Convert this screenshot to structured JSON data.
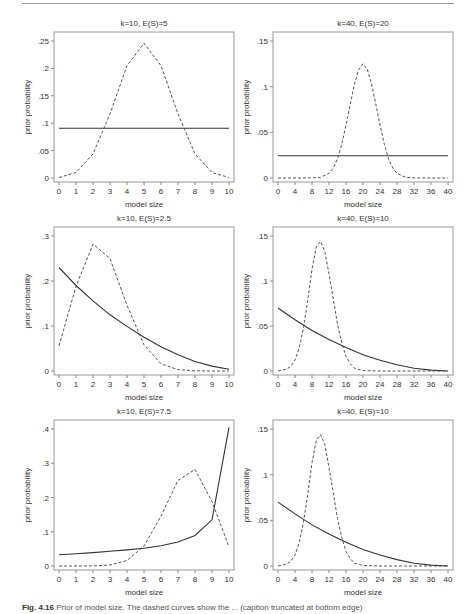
{
  "figure": {
    "caption_label": "Fig. 4.16",
    "caption_text": "Prior of model size. The dashed curves show the ... (caption truncated at bottom edge)"
  },
  "chart_data": [
    {
      "id": "panel-1",
      "type": "line",
      "title": "k=10, E(S)=5",
      "xlabel": "model size",
      "ylabel": "prior probability",
      "xlim": [
        0,
        10
      ],
      "ylim": [
        0,
        0.25
      ],
      "xticks": [
        0,
        1,
        2,
        3,
        4,
        5,
        6,
        7,
        8,
        9,
        10
      ],
      "xtick_labels": [
        "0",
        "1",
        "2",
        "3",
        "4",
        "5",
        "6",
        "7",
        "8",
        "9",
        "10"
      ],
      "yticks": [
        0,
        0.05,
        0.1,
        0.15,
        0.2,
        0.25
      ],
      "ytick_labels": [
        "0",
        ".05",
        ".1",
        ".15",
        ".2",
        ".25"
      ],
      "grid": false,
      "series": [
        {
          "name": "fixed (solid)",
          "style": "solid",
          "x": [
            0,
            10
          ],
          "values": [
            0.0909,
            0.0909
          ]
        },
        {
          "name": "random theta (dashed)",
          "style": "dashed",
          "x": [
            0,
            1,
            2,
            3,
            4,
            5,
            6,
            7,
            8,
            9,
            10
          ],
          "values": [
            0.001,
            0.01,
            0.044,
            0.117,
            0.205,
            0.246,
            0.205,
            0.117,
            0.044,
            0.01,
            0.001
          ]
        }
      ]
    },
    {
      "id": "panel-2",
      "type": "line",
      "title": "k=40, E(S)=20",
      "xlabel": "model size",
      "ylabel": "prior probability",
      "xlim": [
        0,
        40
      ],
      "ylim": [
        0,
        0.15
      ],
      "xticks": [
        0,
        4,
        8,
        12,
        16,
        20,
        24,
        28,
        32,
        36,
        40
      ],
      "xtick_labels": [
        "0",
        "4",
        "8",
        "12",
        "16",
        "20",
        "24",
        "28",
        "32",
        "36",
        "40"
      ],
      "yticks": [
        0,
        0.05,
        0.1,
        0.15
      ],
      "ytick_labels": [
        "0",
        ".05",
        ".1",
        ".15"
      ],
      "grid": false,
      "series": [
        {
          "name": "fixed (solid)",
          "style": "solid",
          "x": [
            0,
            40
          ],
          "values": [
            0.0244,
            0.0244
          ]
        },
        {
          "name": "random theta (dashed)",
          "style": "dashed",
          "x": [
            0,
            4,
            8,
            10,
            12,
            13,
            14,
            15,
            16,
            17,
            18,
            19,
            20,
            21,
            22,
            23,
            24,
            25,
            26,
            27,
            28,
            30,
            32,
            36,
            40
          ],
          "values": [
            0,
            0,
            0.0001,
            0.0008,
            0.005,
            0.011,
            0.021,
            0.037,
            0.058,
            0.081,
            0.103,
            0.119,
            0.125,
            0.119,
            0.103,
            0.081,
            0.058,
            0.037,
            0.021,
            0.011,
            0.005,
            0.0008,
            0.0001,
            0,
            0
          ]
        }
      ]
    },
    {
      "id": "panel-3",
      "type": "line",
      "title": "k=10, E(S)=2.5",
      "xlabel": "model size",
      "ylabel": "prior probability",
      "xlim": [
        0,
        10
      ],
      "ylim": [
        0,
        0.3
      ],
      "xticks": [
        0,
        1,
        2,
        3,
        4,
        5,
        6,
        7,
        8,
        9,
        10
      ],
      "xtick_labels": [
        "0",
        "1",
        "2",
        "3",
        "4",
        "5",
        "6",
        "7",
        "8",
        "9",
        "10"
      ],
      "yticks": [
        0,
        0.1,
        0.2,
        0.3
      ],
      "ytick_labels": [
        "0",
        ".1",
        ".2",
        ".3"
      ],
      "grid": false,
      "series": [
        {
          "name": "random theta (solid)",
          "style": "solid",
          "x": [
            0,
            1,
            2,
            3,
            4,
            5,
            6,
            7,
            8,
            9,
            10
          ],
          "values": [
            0.23,
            0.19,
            0.156,
            0.125,
            0.099,
            0.075,
            0.054,
            0.036,
            0.021,
            0.011,
            0.004
          ]
        },
        {
          "name": "fixed (dashed)",
          "style": "dashed",
          "x": [
            0,
            1,
            2,
            3,
            4,
            5,
            6,
            7,
            8,
            9,
            10
          ],
          "values": [
            0.056,
            0.188,
            0.282,
            0.25,
            0.146,
            0.058,
            0.016,
            0.003,
            0.0004,
            0,
            0
          ]
        }
      ]
    },
    {
      "id": "panel-4",
      "type": "line",
      "title": "k=40, E(S)=10",
      "xlabel": "model size",
      "ylabel": "prior probability",
      "xlim": [
        0,
        40
      ],
      "ylim": [
        0,
        0.15
      ],
      "xticks": [
        0,
        4,
        8,
        12,
        16,
        20,
        24,
        28,
        32,
        36,
        40
      ],
      "xtick_labels": [
        "0",
        "4",
        "8",
        "12",
        "16",
        "20",
        "24",
        "28",
        "32",
        "36",
        "40"
      ],
      "yticks": [
        0,
        0.05,
        0.1,
        0.15
      ],
      "ytick_labels": [
        "0",
        ".05",
        ".1",
        ".15"
      ],
      "grid": false,
      "series": [
        {
          "name": "random theta (solid)",
          "style": "solid",
          "x": [
            0,
            4,
            8,
            12,
            16,
            20,
            24,
            28,
            32,
            36,
            40
          ],
          "values": [
            0.07,
            0.057,
            0.045,
            0.035,
            0.026,
            0.018,
            0.012,
            0.007,
            0.003,
            0.001,
            0
          ]
        },
        {
          "name": "fixed (dashed)",
          "style": "dashed",
          "x": [
            0,
            2,
            3,
            4,
            5,
            6,
            7,
            8,
            9,
            10,
            11,
            12,
            13,
            14,
            15,
            16,
            17,
            18,
            20,
            24,
            28,
            32,
            36,
            40
          ],
          "values": [
            0,
            0.002,
            0.005,
            0.012,
            0.026,
            0.048,
            0.079,
            0.113,
            0.138,
            0.144,
            0.133,
            0.108,
            0.08,
            0.052,
            0.031,
            0.016,
            0.008,
            0.003,
            0.0005,
            0,
            0,
            0,
            0,
            0
          ]
        }
      ]
    },
    {
      "id": "panel-5",
      "type": "line",
      "title": "k=10, E(S)=7.5",
      "xlabel": "model size",
      "ylabel": "prior probability",
      "xlim": [
        0,
        10
      ],
      "ylim": [
        0,
        0.4
      ],
      "xticks": [
        0,
        1,
        2,
        3,
        4,
        5,
        6,
        7,
        8,
        9,
        10
      ],
      "xtick_labels": [
        "0",
        "1",
        "2",
        "3",
        "4",
        "5",
        "6",
        "7",
        "8",
        "9",
        "10"
      ],
      "yticks": [
        0,
        0.1,
        0.2,
        0.3,
        0.4
      ],
      "ytick_labels": [
        "0",
        ".1",
        ".2",
        ".3",
        ".4"
      ],
      "grid": false,
      "series": [
        {
          "name": "random theta (solid)",
          "style": "solid",
          "x": [
            0,
            1,
            2,
            3,
            4,
            5,
            6,
            7,
            8,
            9,
            10
          ],
          "values": [
            0.033,
            0.036,
            0.039,
            0.043,
            0.047,
            0.052,
            0.059,
            0.07,
            0.089,
            0.135,
            0.405
          ]
        },
        {
          "name": "fixed (dashed)",
          "style": "dashed",
          "x": [
            0,
            1,
            2,
            3,
            4,
            5,
            6,
            7,
            8,
            9,
            10
          ],
          "values": [
            0,
            0,
            0.0004,
            0.003,
            0.016,
            0.058,
            0.146,
            0.25,
            0.282,
            0.188,
            0.056
          ]
        }
      ]
    },
    {
      "id": "panel-6",
      "type": "line",
      "title": "k=40, E(S)=10",
      "xlabel": "model size",
      "ylabel": "prior probability",
      "xlim": [
        0,
        40
      ],
      "ylim": [
        0,
        0.15
      ],
      "xticks": [
        0,
        4,
        8,
        12,
        16,
        20,
        24,
        28,
        32,
        36,
        40
      ],
      "xtick_labels": [
        "0",
        "4",
        "8",
        "12",
        "16",
        "20",
        "24",
        "28",
        "32",
        "36",
        "40"
      ],
      "yticks": [
        0,
        0.05,
        0.1,
        0.15
      ],
      "ytick_labels": [
        "0",
        ".05",
        ".1",
        ".15"
      ],
      "grid": false,
      "series": [
        {
          "name": "random theta (solid)",
          "style": "solid",
          "x": [
            0,
            4,
            8,
            12,
            16,
            20,
            24,
            28,
            32,
            36,
            40
          ],
          "values": [
            0.07,
            0.057,
            0.045,
            0.035,
            0.026,
            0.018,
            0.012,
            0.007,
            0.003,
            0.001,
            0
          ]
        },
        {
          "name": "fixed (dashed)",
          "style": "dashed",
          "x": [
            0,
            2,
            3,
            4,
            5,
            6,
            7,
            8,
            9,
            10,
            11,
            12,
            13,
            14,
            15,
            16,
            17,
            18,
            20,
            24,
            28,
            32,
            36,
            40
          ],
          "values": [
            0,
            0.002,
            0.005,
            0.012,
            0.026,
            0.048,
            0.079,
            0.113,
            0.138,
            0.144,
            0.133,
            0.108,
            0.08,
            0.052,
            0.031,
            0.016,
            0.008,
            0.003,
            0.0005,
            0,
            0,
            0,
            0,
            0
          ]
        }
      ]
    }
  ]
}
